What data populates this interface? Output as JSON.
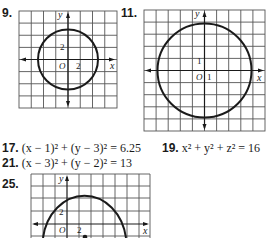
{
  "problems": {
    "p9": {
      "number": "9.",
      "graph": {
        "x_label": "x",
        "y_label": "y",
        "origin_label": "O",
        "x_tick": "2",
        "y_tick": "2",
        "description": "Circle centered at origin, radius 2.5 (grid unit 1 per cell, ticks every 2)"
      }
    },
    "p11": {
      "number": "11.",
      "graph": {
        "x_label": "x",
        "y_label": "y",
        "origin_label": "O",
        "x_tick": "1",
        "y_tick": "1",
        "description": "Circle centered at origin, radius 4"
      }
    },
    "p17": {
      "number": "17.",
      "equation": "(x − 1)² + (y − 3)² = 6.25"
    },
    "p19": {
      "number": "19.",
      "equation": "x² + y² + z² = 16"
    },
    "p21": {
      "number": "21.",
      "equation": "(x − 3)² + (y − 2)² = 13"
    },
    "p25": {
      "number": "25.",
      "graph": {
        "x_label": "x",
        "y_label": "y",
        "origin_label": "O",
        "x_tick": "2",
        "y_tick": "2",
        "description": "Upper arc of circle with center dot below x-axis"
      }
    }
  },
  "colors": {
    "ink": "#1a1a1a",
    "grid": "#555555",
    "background": "#ffffff"
  }
}
